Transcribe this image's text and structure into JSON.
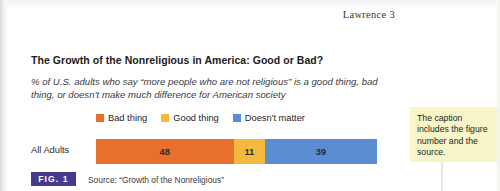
{
  "page": {
    "running_head": "Lawrence 3"
  },
  "figure": {
    "title": "The Growth of the Nonreligious in America: Good or Bad?",
    "subtitle": "% of U.S. adults who say “more people who are not religious” is a good thing, bad thing, or doesn’t make much difference for American society",
    "category_label": "All Adults",
    "badge": "FIG. 1",
    "source": "Source: “Growth of the Nonreligious”",
    "badge_color": "#453a8c"
  },
  "annotation": {
    "text": "The caption includes the figure number and the source.",
    "background": "#f8f5c8"
  },
  "chart_data": {
    "type": "bar",
    "orientation": "horizontal-stacked",
    "title": "The Growth of the Nonreligious in America: Good or Bad?",
    "subtitle": "% of U.S. adults who say “more people who are not religious” is a good thing, bad thing, or doesn’t make much difference for American society",
    "categories": [
      "All Adults"
    ],
    "series": [
      {
        "name": "Bad thing",
        "values": [
          48
        ],
        "color": "#e8702a"
      },
      {
        "name": "Good thing",
        "values": [
          11
        ],
        "color": "#f6b93f"
      },
      {
        "name": "Doesn't matter",
        "values": [
          39
        ],
        "color": "#5a8ed1"
      }
    ],
    "xlabel": "",
    "ylabel": "",
    "xlim": [
      0,
      98
    ],
    "grid": false,
    "legend_position": "top",
    "value_labels": [
      "48",
      "11",
      "39"
    ],
    "units": "percent"
  }
}
